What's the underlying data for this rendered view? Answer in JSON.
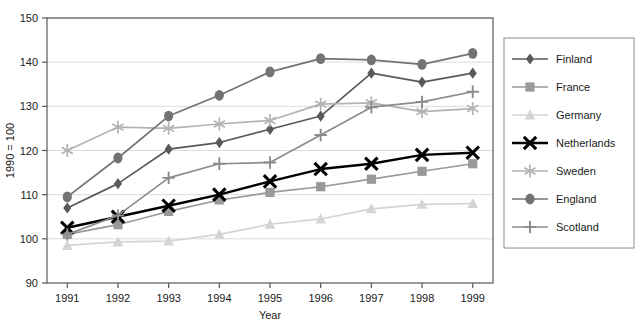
{
  "chart_data": {
    "type": "line",
    "title": "",
    "xlabel": "Year",
    "ylabel": "1990 = 100",
    "categories": [
      "1991",
      "1992",
      "1993",
      "1994",
      "1995",
      "1996",
      "1997",
      "1998",
      "1999"
    ],
    "x": [
      1991,
      1992,
      1993,
      1994,
      1995,
      1996,
      1997,
      1998,
      1999
    ],
    "xlim": [
      1990.6,
      1999.4
    ],
    "ylim": [
      90,
      150
    ],
    "yticks": [
      90,
      100,
      110,
      120,
      130,
      140,
      150
    ],
    "xticks": [
      "1991",
      "1992",
      "1993",
      "1994",
      "1995",
      "1996",
      "1997",
      "1998",
      "1999"
    ],
    "grid": "horizontal",
    "legend_position": "right",
    "series": [
      {
        "name": "Finland",
        "marker": "diamond",
        "color": "#595959",
        "values": [
          107.0,
          112.5,
          120.3,
          121.8,
          124.8,
          127.8,
          137.5,
          135.5,
          137.5
        ]
      },
      {
        "name": "France",
        "marker": "square",
        "color": "#999999",
        "values": [
          101.0,
          103.2,
          106.2,
          108.8,
          110.5,
          111.8,
          113.5,
          115.3,
          117.0
        ]
      },
      {
        "name": "Germany",
        "marker": "triangle",
        "color": "#d4d4d4",
        "values": [
          98.5,
          99.3,
          99.5,
          101.0,
          103.3,
          104.5,
          106.8,
          107.8,
          108.0
        ]
      },
      {
        "name": "Netherlands",
        "marker": "x",
        "color": "#000000",
        "values": [
          102.5,
          105.0,
          107.5,
          110.0,
          113.0,
          115.8,
          117.0,
          119.0,
          119.5
        ]
      },
      {
        "name": "Sweden",
        "marker": "asterisk",
        "color": "#b3b3b3",
        "values": [
          120.0,
          125.3,
          125.0,
          126.0,
          126.8,
          130.5,
          130.8,
          128.8,
          129.5
        ]
      },
      {
        "name": "England",
        "marker": "circle",
        "color": "#737373",
        "values": [
          109.5,
          118.3,
          127.8,
          132.5,
          137.8,
          140.8,
          140.5,
          139.5,
          142.0
        ]
      },
      {
        "name": "Scotland",
        "marker": "plus",
        "color": "#8c8c8c",
        "values": [
          101.0,
          105.3,
          113.8,
          117.0,
          117.3,
          123.5,
          129.8,
          131.0,
          133.3
        ]
      }
    ]
  },
  "legend": {
    "entries": [
      {
        "label": "Finland"
      },
      {
        "label": "France"
      },
      {
        "label": "Germany"
      },
      {
        "label": "Netherlands"
      },
      {
        "label": "Sweden"
      },
      {
        "label": "England"
      },
      {
        "label": "Scotland"
      }
    ]
  }
}
